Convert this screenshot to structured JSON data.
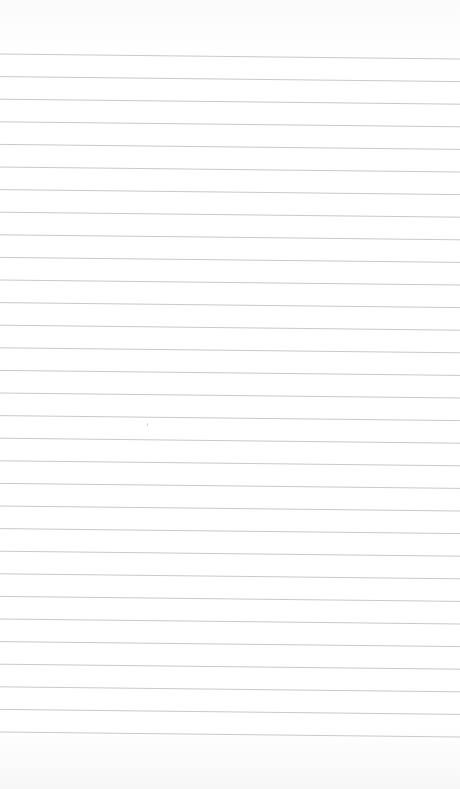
{
  "page": {
    "type": "lined-notebook-paper",
    "background_color": "#ffffff",
    "line_color": "#c9c9c9",
    "line_count": 31,
    "line_spacing_px": 22.6,
    "first_line_left_y": 54,
    "tilt_px_across_width": 5,
    "text_content": ""
  }
}
